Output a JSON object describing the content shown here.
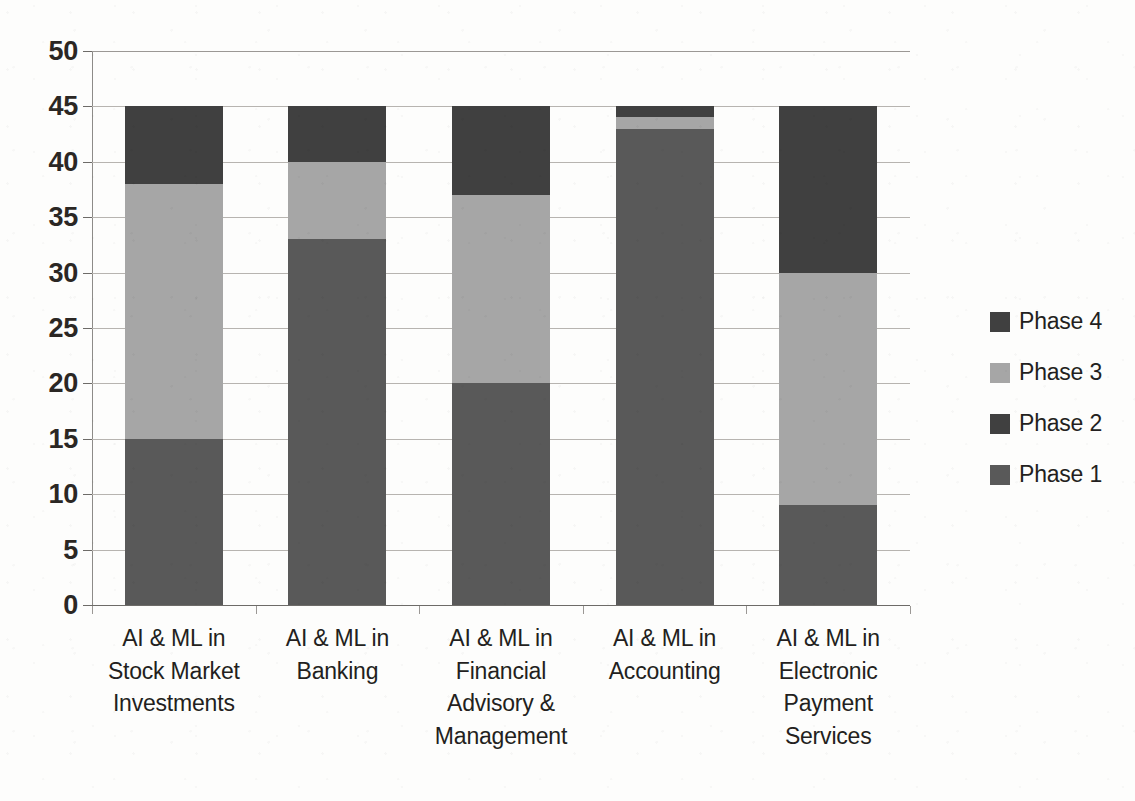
{
  "chart_data": {
    "type": "bar",
    "subtype": "stacked-bar",
    "title": "",
    "xlabel": "",
    "ylabel": "",
    "ylim": [
      0,
      50
    ],
    "ytick_step": 5,
    "yticks": [
      50,
      45,
      40,
      35,
      30,
      25,
      20,
      15,
      10,
      5,
      0
    ],
    "grid": true,
    "legend_position": "right",
    "categories": [
      "AI & ML in Stock Market Investments",
      "AI & ML in Banking",
      "AI & ML in Financial Advisory & Management",
      "AI & ML in Accounting",
      "AI  & ML in Electronic Payment Services"
    ],
    "category_lines": [
      [
        "AI & ML in",
        "Stock Market",
        "Investments"
      ],
      [
        "AI & ML in",
        "Banking"
      ],
      [
        "AI & ML in",
        "Financial",
        "Advisory &",
        "Management"
      ],
      [
        "AI & ML in",
        "Accounting"
      ],
      [
        "AI  & ML in",
        "Electronic",
        "Payment",
        "Services"
      ]
    ],
    "series": [
      {
        "name": "Phase 1",
        "color": "#595959",
        "values": [
          15,
          33,
          20,
          43,
          9
        ]
      },
      {
        "name": "Phase 2",
        "color": "#404040",
        "values": [
          0,
          0,
          0,
          0,
          0
        ]
      },
      {
        "name": "Phase 3",
        "color": "#a6a6a6",
        "values": [
          23,
          7,
          17,
          1,
          21
        ]
      },
      {
        "name": "Phase 4",
        "color": "#404040",
        "values": [
          7,
          5,
          8,
          1,
          15
        ]
      }
    ],
    "totals": [
      45,
      45,
      45,
      45,
      45
    ],
    "legend_order": [
      "Phase 4",
      "Phase 3",
      "Phase 2",
      "Phase 1"
    ]
  },
  "legend": {
    "items": [
      {
        "label": "Phase 4",
        "color": "#404040"
      },
      {
        "label": "Phase 3",
        "color": "#a6a6a6"
      },
      {
        "label": "Phase 2",
        "color": "#404040"
      },
      {
        "label": "Phase 1",
        "color": "#595959"
      }
    ]
  },
  "axis": {
    "y_labels": [
      "50",
      "45",
      "40",
      "35",
      "30",
      "25",
      "20",
      "15",
      "10",
      "5",
      "0"
    ]
  }
}
